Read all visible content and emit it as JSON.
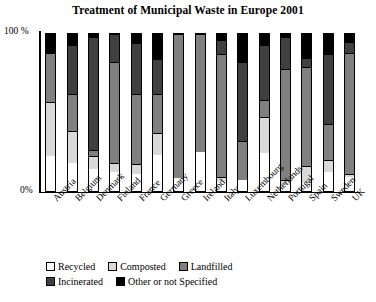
{
  "chart_data": {
    "type": "bar",
    "subtype": "stacked-bar-100-percent",
    "title": "Treatment of Municipal Waste in Europe 2001",
    "xlabel": "",
    "ylabel": "",
    "ylim": [
      0,
      100
    ],
    "ytick_labels": [
      "100 %",
      "0%"
    ],
    "ytick_values": [
      100,
      0
    ],
    "grid": false,
    "legend_position": "bottom",
    "categories": [
      "Austria",
      "Belgium",
      "Denmark",
      "Finland",
      "France",
      "Germany",
      "Greece",
      "Ireland",
      "Italy",
      "Luxembourg",
      "Netherlands",
      "Portugal",
      "Spain",
      "Sweden",
      "UK"
    ],
    "series": [
      {
        "name": "Recycled",
        "color": "#ffffff",
        "values": [
          22,
          18,
          14,
          12,
          11,
          23,
          8,
          25,
          6,
          7,
          24,
          4,
          5,
          12,
          9
        ]
      },
      {
        "name": "Composted",
        "color": "#d9d9d9",
        "values": [
          35,
          20,
          8,
          6,
          6,
          14,
          0,
          0,
          3,
          0,
          23,
          3,
          11,
          8,
          2
        ]
      },
      {
        "name": "Landfilled",
        "color": "#808080",
        "values": [
          31,
          24,
          4,
          64,
          45,
          25,
          92,
          75,
          78,
          25,
          11,
          71,
          63,
          23,
          77
        ]
      },
      {
        "name": "Incinerated",
        "color": "#404040",
        "values": [
          0,
          31,
          72,
          18,
          32,
          22,
          0,
          0,
          9,
          50,
          35,
          20,
          6,
          44,
          7
        ]
      },
      {
        "name": "Other or not Specified",
        "color": "#000000",
        "values": [
          12,
          7,
          2,
          0,
          6,
          16,
          0,
          0,
          4,
          18,
          7,
          2,
          15,
          13,
          5
        ]
      }
    ]
  },
  "legend": {
    "items": [
      {
        "label": "Recycled",
        "color": "#ffffff"
      },
      {
        "label": "Composted",
        "color": "#d9d9d9"
      },
      {
        "label": "Landfilled",
        "color": "#808080"
      },
      {
        "label": "Incinerated",
        "color": "#404040"
      },
      {
        "label": "Other or not Specified",
        "color": "#000000"
      }
    ]
  }
}
